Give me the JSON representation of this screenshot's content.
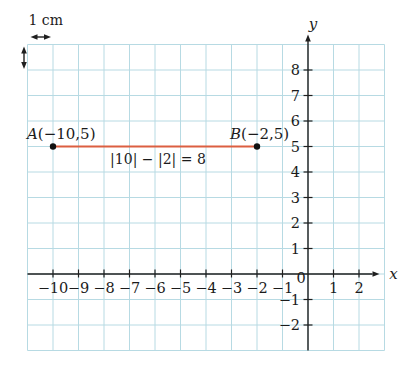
{
  "figure": {
    "background": "#ffffff",
    "grid_color": "#b7dae3",
    "axis_color": "#1f1f1f",
    "accent_color": "#dc5f41",
    "point_color": "#111111"
  },
  "chart_data": {
    "type": "scatter",
    "title": "",
    "xlabel": "x",
    "ylabel": "y",
    "xlim": [
      -11,
      3
    ],
    "ylim": [
      -3,
      9
    ],
    "grid": "on",
    "x_tick_values": [
      -10,
      -9,
      -8,
      -7,
      -6,
      -5,
      -4,
      -3,
      -2,
      -1,
      0,
      1,
      2
    ],
    "x_tick_labels": [
      "−10",
      "−9",
      "−8",
      "−7",
      "−6",
      "−5",
      "−4",
      "−3",
      "−2",
      "−1",
      "0",
      "1",
      "2"
    ],
    "y_tick_values": [
      8,
      7,
      6,
      5,
      4,
      3,
      2,
      1,
      -1,
      -2
    ],
    "y_tick_labels": [
      "8",
      "7",
      "6",
      "5",
      "4",
      "3",
      "2",
      "1",
      "−1",
      "−2"
    ],
    "points": [
      {
        "name": "A",
        "x": -10,
        "y": 5,
        "label": "A(−10,5)"
      },
      {
        "name": "B",
        "x": -2,
        "y": 5,
        "label": "B(−2,5)"
      }
    ],
    "segment": {
      "x1": -10,
      "y1": 5,
      "x2": -2,
      "y2": 5,
      "annotation": "|10| − |2| = 8"
    },
    "scale_indicator": {
      "label": "1 cm",
      "width_units": 1,
      "height_units": 1
    }
  }
}
